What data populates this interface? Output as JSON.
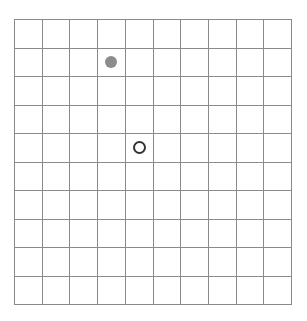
{
  "board": {
    "rows": 10,
    "cols": 10,
    "grid_color": "#8a8a8a",
    "pieces": [
      {
        "row": 1,
        "col": 3,
        "type": "filled",
        "color": "#8c8c8c",
        "name": "filled-gray-dot"
      },
      {
        "row": 4,
        "col": 4,
        "type": "hollow",
        "color": "#333333",
        "name": "hollow-circle"
      }
    ]
  }
}
